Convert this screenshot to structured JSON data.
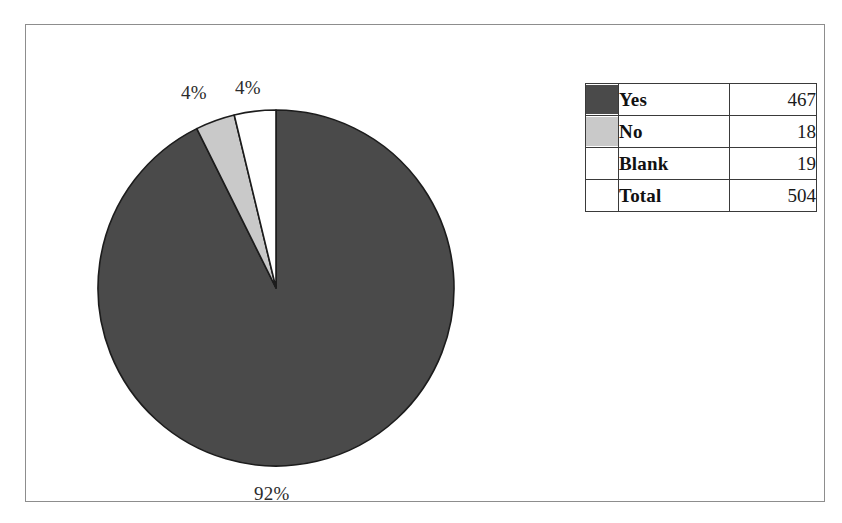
{
  "chart_data": {
    "type": "pie",
    "title": "",
    "categories": [
      "Yes",
      "No",
      "Blank"
    ],
    "values": [
      467,
      18,
      19
    ],
    "percentages": [
      "92%",
      "4%",
      "4%"
    ],
    "total_label": "Total",
    "total_value": 504,
    "colors": [
      "#4a4a4a",
      "#c9c9c9",
      "#ffffff"
    ],
    "legend_position": "right",
    "grid": false,
    "start_angle_deg": 0,
    "direction": "clockwise",
    "slices": [
      {
        "name": "Yes",
        "value": 467,
        "percent_label": "92%",
        "color": "#4a4a4a"
      },
      {
        "name": "No",
        "value": 18,
        "percent_label": "4%",
        "color": "#c9c9c9"
      },
      {
        "name": "Blank",
        "value": 19,
        "percent_label": "4%",
        "color": "#ffffff"
      }
    ]
  },
  "labels": {
    "yes_percent": "92%",
    "no_percent": "4%",
    "blank_percent": "4%"
  },
  "legend": {
    "rows": [
      {
        "label": "Yes",
        "value": "467",
        "color": "#4a4a4a",
        "has_swatch": true
      },
      {
        "label": "No",
        "value": "18",
        "color": "#c9c9c9",
        "has_swatch": true
      },
      {
        "label": "Blank",
        "value": "19",
        "color": "#ffffff",
        "has_swatch": true
      },
      {
        "label": "Total",
        "value": "504",
        "color": "",
        "has_swatch": false
      }
    ]
  }
}
